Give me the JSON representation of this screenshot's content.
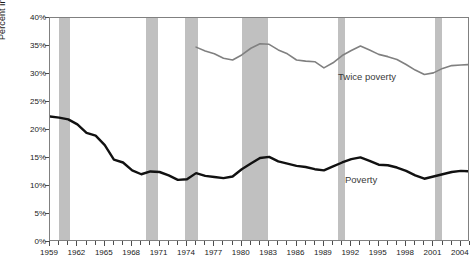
{
  "chart_data": {
    "type": "line",
    "title": "",
    "xlabel": "",
    "ylabel": "Percent in poverty and twice poverty",
    "xlim": [
      1959,
      2005
    ],
    "ylim": [
      0,
      40
    ],
    "ytick_labels": [
      "0%",
      "5%",
      "10%",
      "15%",
      "20%",
      "25%",
      "30%",
      "35%",
      "40%"
    ],
    "ytick_values": [
      0,
      5,
      10,
      15,
      20,
      25,
      30,
      35,
      40
    ],
    "ytick_suffix": "%",
    "xtick_labels": [
      "1959",
      "1962",
      "1965",
      "1968",
      "1971",
      "1974",
      "1977",
      "1980",
      "1983",
      "1986",
      "1989",
      "1992",
      "1995",
      "1998",
      "2001",
      "2004"
    ],
    "xtick_values": [
      1959,
      1962,
      1965,
      1968,
      1971,
      1974,
      1977,
      1980,
      1983,
      1986,
      1989,
      1992,
      1995,
      1998,
      2001,
      2004
    ],
    "xtick_minor_start": 1959,
    "xtick_minor_end": 2005,
    "grid": false,
    "legend_position": "inline-annotations",
    "series": [
      {
        "name": "Twice poverty",
        "color": "#808080",
        "line_width": 1.6,
        "x": [
          1975,
          1976,
          1977,
          1978,
          1979,
          1980,
          1981,
          1982,
          1983,
          1984,
          1985,
          1986,
          1987,
          1988,
          1989,
          1990,
          1991,
          1992,
          1993,
          1994,
          1995,
          1996,
          1997,
          1998,
          1999,
          2000,
          2001,
          2002,
          2003,
          2004,
          2005
        ],
        "values": [
          34.8,
          34.1,
          33.6,
          32.8,
          32.5,
          33.4,
          34.6,
          35.4,
          35.3,
          34.3,
          33.6,
          32.5,
          32.3,
          32.2,
          31.1,
          32.0,
          33.3,
          34.2,
          35.0,
          34.3,
          33.5,
          33.1,
          32.6,
          31.7,
          30.7,
          29.9,
          30.2,
          31.0,
          31.5,
          31.6,
          31.7
        ]
      },
      {
        "name": "Poverty",
        "color": "#111111",
        "line_width": 2.4,
        "x": [
          1959,
          1960,
          1961,
          1962,
          1963,
          1964,
          1965,
          1966,
          1967,
          1968,
          1969,
          1970,
          1971,
          1972,
          1973,
          1974,
          1975,
          1976,
          1977,
          1978,
          1979,
          1980,
          1981,
          1982,
          1983,
          1984,
          1985,
          1986,
          1987,
          1988,
          1989,
          1990,
          1991,
          1992,
          1993,
          1994,
          1995,
          1996,
          1997,
          1998,
          1999,
          2000,
          2001,
          2002,
          2003,
          2004,
          2005
        ],
        "values": [
          22.4,
          22.2,
          21.9,
          21.0,
          19.5,
          19.0,
          17.3,
          14.7,
          14.2,
          12.8,
          12.1,
          12.6,
          12.5,
          11.9,
          11.1,
          11.2,
          12.3,
          11.8,
          11.6,
          11.4,
          11.7,
          13.0,
          14.0,
          15.0,
          15.2,
          14.4,
          14.0,
          13.6,
          13.4,
          13.0,
          12.8,
          13.5,
          14.2,
          14.8,
          15.1,
          14.5,
          13.8,
          13.7,
          13.3,
          12.7,
          11.9,
          11.3,
          11.7,
          12.1,
          12.5,
          12.7,
          12.6
        ]
      }
    ],
    "recession_bands": [
      {
        "label": "1960-1961",
        "start": 1960.0,
        "end": 1961.2
      },
      {
        "label": "1969-1970",
        "start": 1969.5,
        "end": 1970.8
      },
      {
        "label": "1973-1975",
        "start": 1973.8,
        "end": 1975.2
      },
      {
        "label": "1980-1982",
        "start": 1980.0,
        "end": 1982.9
      },
      {
        "label": "1990-1991",
        "start": 1990.5,
        "end": 1991.3
      },
      {
        "label": "2001",
        "start": 2001.2,
        "end": 2001.9
      }
    ],
    "annotations": [
      {
        "name": "twice-poverty",
        "text": "Twice poverty"
      },
      {
        "name": "poverty",
        "text": "Poverty"
      }
    ],
    "colors": {
      "recession_band": "#c0c0c0",
      "poverty_line": "#111111",
      "twice_poverty_line": "#808080",
      "axis": "#4d4d4d",
      "frame": "#808080",
      "text": "#1a1a1a",
      "annotation_text": "#3a3a3a",
      "background": "#ffffff"
    }
  }
}
